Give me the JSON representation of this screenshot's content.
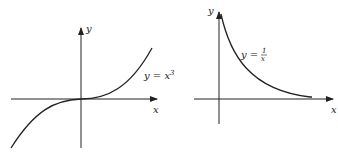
{
  "figures": [
    {
      "name": "cubic",
      "equation_lhs": "y = x",
      "equation_exp": "3",
      "x_axis_label": "x",
      "y_axis_label": "y"
    },
    {
      "name": "reciprocal",
      "equation_lhs": "y =",
      "equation_num": "1",
      "equation_den": "x",
      "x_axis_label": "x",
      "y_axis_label": "y"
    }
  ],
  "colors": {
    "ink": "#222222",
    "background": "#ffffff"
  }
}
